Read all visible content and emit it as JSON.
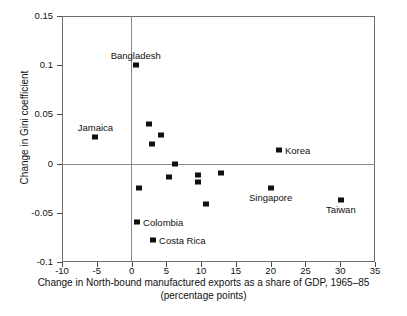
{
  "chart_data": {
    "type": "scatter",
    "title": "",
    "xlabel": "Change in North-bound manufactured exports as a share of GDP, 1965–85",
    "xlabel_line2": "(percentage points)",
    "ylabel": "Change in Gini coefficient",
    "xlim": [
      -10,
      35
    ],
    "ylim": [
      -0.1,
      0.15
    ],
    "xticks": [
      "-10",
      "-5",
      "0",
      "5",
      "10",
      "15",
      "20",
      "25",
      "30",
      "35"
    ],
    "xtick_values": [
      -10,
      -5,
      0,
      5,
      10,
      15,
      20,
      25,
      30,
      35
    ],
    "yticks": [
      "0.15",
      "0.1",
      "0.05",
      "0",
      "-0.05",
      "-0.1"
    ],
    "ytick_values": [
      0.15,
      0.1,
      0.05,
      0,
      -0.05,
      -0.1
    ],
    "grid": false,
    "legend": "none",
    "zero_lines": true,
    "marker_color": "#111111",
    "axis_color": "#6e6e6e",
    "points": [
      {
        "label": "Bangladesh",
        "x": 0.6,
        "y": 0.1,
        "label_pos": "above"
      },
      {
        "label": "Jamaica",
        "x": -5.2,
        "y": 0.027,
        "label_pos": "above"
      },
      {
        "label": "",
        "x": 2.5,
        "y": 0.04,
        "label_pos": "none"
      },
      {
        "label": "",
        "x": 4.2,
        "y": 0.029,
        "label_pos": "none"
      },
      {
        "label": "",
        "x": 3.0,
        "y": 0.02,
        "label_pos": "none"
      },
      {
        "label": "Korea",
        "x": 21.2,
        "y": 0.014,
        "label_pos": "right"
      },
      {
        "label": "",
        "x": 6.3,
        "y": 0.0,
        "label_pos": "none"
      },
      {
        "label": "",
        "x": 5.4,
        "y": -0.014,
        "label_pos": "none"
      },
      {
        "label": "",
        "x": 9.5,
        "y": -0.012,
        "label_pos": "none"
      },
      {
        "label": "",
        "x": 9.5,
        "y": -0.019,
        "label_pos": "none"
      },
      {
        "label": "",
        "x": 12.8,
        "y": -0.01,
        "label_pos": "none"
      },
      {
        "label": "",
        "x": 1.1,
        "y": -0.025,
        "label_pos": "none"
      },
      {
        "label": "Singapore",
        "x": 20.0,
        "y": -0.025,
        "label_pos": "below"
      },
      {
        "label": "",
        "x": 10.7,
        "y": -0.041,
        "label_pos": "none"
      },
      {
        "label": "Taiwan",
        "x": 30.1,
        "y": -0.037,
        "label_pos": "below"
      },
      {
        "label": "Colombia",
        "x": 0.8,
        "y": -0.059,
        "label_pos": "right"
      },
      {
        "label": "Costa Rica",
        "x": 3.1,
        "y": -0.078,
        "label_pos": "right"
      }
    ]
  }
}
